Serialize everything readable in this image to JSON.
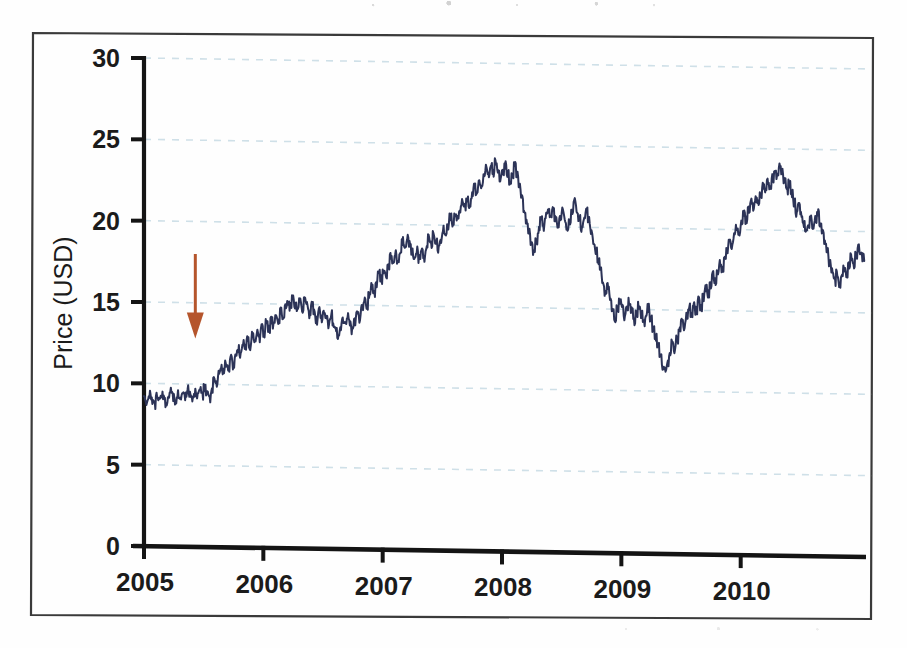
{
  "figure": {
    "frame_border_color": "#3a3a3a",
    "background_color": "#fefefe"
  },
  "chart_data": {
    "type": "line",
    "title": "",
    "xlabel": "",
    "ylabel": "Price (USD)",
    "xlim": [
      2005.0,
      2011.05
    ],
    "ylim": [
      0,
      30
    ],
    "xticks": [
      "2005",
      "2006",
      "2007",
      "2008",
      "2009",
      "2010"
    ],
    "xtick_values": [
      2005,
      2006,
      2007,
      2008,
      2009,
      2010
    ],
    "yticks": [
      "0",
      "5",
      "10",
      "15",
      "20",
      "25",
      "30"
    ],
    "ytick_values": [
      0,
      5,
      10,
      15,
      20,
      25,
      30
    ],
    "grid": "horizontal dashed light-blue at every y tick",
    "legend": "none",
    "series": [
      {
        "name": "Price (USD)",
        "color": "#2c3357",
        "line_width": 2,
        "x": [
          2005.0,
          2005.02,
          2005.04,
          2005.06,
          2005.08,
          2005.1,
          2005.12,
          2005.14,
          2005.16,
          2005.18,
          2005.2,
          2005.22,
          2005.24,
          2005.26,
          2005.28,
          2005.3,
          2005.32,
          2005.34,
          2005.36,
          2005.38,
          2005.4,
          2005.42,
          2005.44,
          2005.46,
          2005.48,
          2005.5,
          2005.52,
          2005.54,
          2005.56,
          2005.58,
          2005.6,
          2005.62,
          2005.64,
          2005.66,
          2005.68,
          2005.7,
          2005.72,
          2005.74,
          2005.76,
          2005.78,
          2005.8,
          2005.82,
          2005.84,
          2005.86,
          2005.88,
          2005.9,
          2005.92,
          2005.94,
          2005.96,
          2005.98,
          2006.0,
          2006.02,
          2006.04,
          2006.06,
          2006.08,
          2006.1,
          2006.12,
          2006.14,
          2006.16,
          2006.18,
          2006.2,
          2006.22,
          2006.24,
          2006.26,
          2006.28,
          2006.3,
          2006.32,
          2006.34,
          2006.36,
          2006.38,
          2006.4,
          2006.42,
          2006.44,
          2006.46,
          2006.48,
          2006.5,
          2006.52,
          2006.54,
          2006.56,
          2006.58,
          2006.6,
          2006.62,
          2006.64,
          2006.66,
          2006.68,
          2006.7,
          2006.72,
          2006.74,
          2006.76,
          2006.78,
          2006.8,
          2006.82,
          2006.84,
          2006.86,
          2006.88,
          2006.9,
          2006.92,
          2006.94,
          2006.96,
          2006.98,
          2007.0,
          2007.02,
          2007.04,
          2007.06,
          2007.08,
          2007.1,
          2007.12,
          2007.14,
          2007.16,
          2007.18,
          2007.2,
          2007.22,
          2007.24,
          2007.26,
          2007.28,
          2007.3,
          2007.32,
          2007.34,
          2007.36,
          2007.38,
          2007.4,
          2007.42,
          2007.44,
          2007.46,
          2007.48,
          2007.5,
          2007.52,
          2007.54,
          2007.56,
          2007.58,
          2007.6,
          2007.62,
          2007.64,
          2007.66,
          2007.68,
          2007.7,
          2007.72,
          2007.74,
          2007.76,
          2007.78,
          2007.8,
          2007.82,
          2007.84,
          2007.86,
          2007.88,
          2007.9,
          2007.92,
          2007.94,
          2007.96,
          2007.98,
          2008.0,
          2008.02,
          2008.04,
          2008.06,
          2008.08,
          2008.1,
          2008.12,
          2008.14,
          2008.16,
          2008.18,
          2008.2,
          2008.22,
          2008.24,
          2008.26,
          2008.28,
          2008.3,
          2008.32,
          2008.34,
          2008.36,
          2008.38,
          2008.4,
          2008.42,
          2008.44,
          2008.46,
          2008.48,
          2008.5,
          2008.52,
          2008.54,
          2008.56,
          2008.58,
          2008.6,
          2008.62,
          2008.64,
          2008.66,
          2008.68,
          2008.7,
          2008.72,
          2008.74,
          2008.76,
          2008.78,
          2008.8,
          2008.82,
          2008.84,
          2008.86,
          2008.88,
          2008.9,
          2008.92,
          2008.94,
          2008.96,
          2008.98,
          2009.0,
          2009.02,
          2009.04,
          2009.06,
          2009.08,
          2009.1,
          2009.12,
          2009.14,
          2009.16,
          2009.18,
          2009.2,
          2009.22,
          2009.24,
          2009.26,
          2009.28,
          2009.3,
          2009.32,
          2009.34,
          2009.36,
          2009.38,
          2009.4,
          2009.42,
          2009.44,
          2009.46,
          2009.48,
          2009.5,
          2009.52,
          2009.54,
          2009.56,
          2009.58,
          2009.6,
          2009.62,
          2009.64,
          2009.66,
          2009.68,
          2009.7,
          2009.72,
          2009.74,
          2009.76,
          2009.78,
          2009.8,
          2009.82,
          2009.84,
          2009.86,
          2009.88,
          2009.9,
          2009.92,
          2009.94,
          2009.96,
          2009.98,
          2010.0,
          2010.02,
          2010.04,
          2010.06,
          2010.08,
          2010.1,
          2010.12,
          2010.14,
          2010.16,
          2010.18,
          2010.2,
          2010.22,
          2010.24,
          2010.26,
          2010.28,
          2010.3,
          2010.32,
          2010.34,
          2010.36,
          2010.38,
          2010.4,
          2010.42,
          2010.44,
          2010.46,
          2010.48,
          2010.5,
          2010.52,
          2010.54,
          2010.56,
          2010.58,
          2010.6,
          2010.62,
          2010.64,
          2010.66,
          2010.68,
          2010.7,
          2010.72,
          2010.74,
          2010.76,
          2010.78,
          2010.8,
          2010.82,
          2010.84,
          2010.86,
          2010.88,
          2010.9,
          2010.92,
          2010.94,
          2010.96,
          2010.98,
          2011.0,
          2011.02
        ],
        "y": [
          9.1,
          8.8,
          9.3,
          9.0,
          8.7,
          9.2,
          8.9,
          9.4,
          9.1,
          8.8,
          9.3,
          9.6,
          9.2,
          8.9,
          9.4,
          9.1,
          9.5,
          9.2,
          9.7,
          9.3,
          9.0,
          9.5,
          9.2,
          9.6,
          9.3,
          9.8,
          9.4,
          9.1,
          9.6,
          10.3,
          10.0,
          10.6,
          11.0,
          10.7,
          11.3,
          11.0,
          11.6,
          11.2,
          11.8,
          12.2,
          11.9,
          12.5,
          12.2,
          12.8,
          12.4,
          13.0,
          12.6,
          13.2,
          12.9,
          13.5,
          13.2,
          13.8,
          13.4,
          14.0,
          13.7,
          14.3,
          14.0,
          14.6,
          14.2,
          14.8,
          15.2,
          14.8,
          15.4,
          15.0,
          14.6,
          15.1,
          14.7,
          15.3,
          14.9,
          14.4,
          15.0,
          14.5,
          14.0,
          14.6,
          14.1,
          14.7,
          14.3,
          13.8,
          14.4,
          13.9,
          13.4,
          13.0,
          13.6,
          14.1,
          13.7,
          14.3,
          13.9,
          13.4,
          14.0,
          14.6,
          14.2,
          14.8,
          15.4,
          15.0,
          15.6,
          16.2,
          15.8,
          16.4,
          17.0,
          16.6,
          17.2,
          16.8,
          17.4,
          18.0,
          17.6,
          18.2,
          17.8,
          18.4,
          19.0,
          18.6,
          19.2,
          18.8,
          18.3,
          17.8,
          18.4,
          17.9,
          18.5,
          18.0,
          18.6,
          19.2,
          18.8,
          19.4,
          19.0,
          18.5,
          19.1,
          19.7,
          19.3,
          19.9,
          20.5,
          20.1,
          20.7,
          20.3,
          20.9,
          21.5,
          21.1,
          21.7,
          21.3,
          21.9,
          22.5,
          22.1,
          22.7,
          22.3,
          22.9,
          23.5,
          23.1,
          23.7,
          23.3,
          23.9,
          23.5,
          22.9,
          23.4,
          23.8,
          23.2,
          22.6,
          23.2,
          23.7,
          23.1,
          22.5,
          21.8,
          21.1,
          20.4,
          19.7,
          19.1,
          18.5,
          19.1,
          19.8,
          20.4,
          20.0,
          20.6,
          21.0,
          20.5,
          21.1,
          20.6,
          20.0,
          20.6,
          21.1,
          20.5,
          19.9,
          20.4,
          21.0,
          21.6,
          21.1,
          20.5,
          19.9,
          20.5,
          21.0,
          20.4,
          19.8,
          19.2,
          18.6,
          18.0,
          17.3,
          16.6,
          15.9,
          16.5,
          15.8,
          15.1,
          14.4,
          15.0,
          15.6,
          15.1,
          14.5,
          15.0,
          15.5,
          14.9,
          14.3,
          14.8,
          15.3,
          14.7,
          14.1,
          14.6,
          15.1,
          14.5,
          13.9,
          13.3,
          12.7,
          12.1,
          11.5,
          11.2,
          11.8,
          12.4,
          13.0,
          12.6,
          13.2,
          13.8,
          14.4,
          14.0,
          14.6,
          15.2,
          14.8,
          15.4,
          15.0,
          15.6,
          15.2,
          15.8,
          16.4,
          16.0,
          16.6,
          17.2,
          16.8,
          17.4,
          18.0,
          17.6,
          18.2,
          18.8,
          19.4,
          19.0,
          19.6,
          20.2,
          19.8,
          20.4,
          21.0,
          20.6,
          21.2,
          21.8,
          21.4,
          22.0,
          21.6,
          22.2,
          22.8,
          22.4,
          23.0,
          22.6,
          23.2,
          23.8,
          23.4,
          24.0,
          23.6,
          23.0,
          22.4,
          22.9,
          22.3,
          21.7,
          21.1,
          21.6,
          21.0,
          20.4,
          19.8,
          20.3,
          20.8,
          20.2,
          20.7,
          21.1,
          20.5,
          19.9,
          19.3,
          18.7,
          18.1,
          17.5,
          16.9,
          17.4,
          16.8,
          17.3,
          17.8,
          17.4,
          17.9,
          18.4,
          18.0,
          18.5,
          19.0,
          18.6,
          18.4
        ]
      }
    ],
    "annotations": [
      {
        "name": "event-arrow",
        "type": "down-arrow",
        "color": "#b5552c",
        "x_value": 2005.43,
        "y_top": 18.0,
        "y_bottom": 12.8
      }
    ]
  }
}
